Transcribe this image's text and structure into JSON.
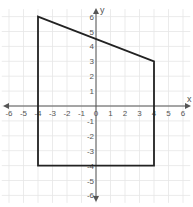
{
  "chart_data": {
    "type": "line",
    "title": "",
    "xlabel": "x",
    "ylabel": "y",
    "xlim": [
      -6,
      6
    ],
    "ylim": [
      -6,
      6
    ],
    "grid": true,
    "x_ticks": [
      -6,
      -5,
      -4,
      -3,
      -2,
      -1,
      0,
      1,
      2,
      3,
      4,
      5,
      6
    ],
    "y_ticks": [
      -6,
      -5,
      -4,
      -3,
      -2,
      -1,
      1,
      2,
      3,
      4,
      5,
      6
    ],
    "series": [
      {
        "name": "polygon",
        "closed": true,
        "points": [
          [
            -4,
            6
          ],
          [
            4,
            3
          ],
          [
            4,
            -4
          ],
          [
            -4,
            -4
          ]
        ]
      }
    ]
  },
  "colors": {
    "grid": "#e6e6e6",
    "axis": "#555555",
    "shape": "#222222"
  },
  "layout": {
    "origin_x": 96,
    "origin_y": 106,
    "unit_x": 14.5,
    "unit_y": 14.9,
    "x_axis_left": 3,
    "x_axis_right": 191,
    "y_axis_top": 8,
    "y_axis_bottom": 202
  }
}
